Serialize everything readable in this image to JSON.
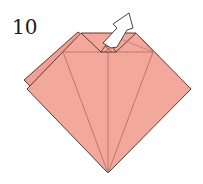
{
  "diagram": {
    "step_number": "10",
    "colors": {
      "paper": "#f3a89c",
      "paper_back": "#eea092",
      "edge": "#5a3a36",
      "crease": "#b06a60",
      "arrow_fill": "#ffffff",
      "arrow_stroke": "#444444"
    },
    "elements": [
      {
        "type": "paper-model",
        "shape": "diamond with folded top flaps"
      },
      {
        "type": "arrow",
        "meaning": "pull out / unfold upward"
      }
    ]
  }
}
